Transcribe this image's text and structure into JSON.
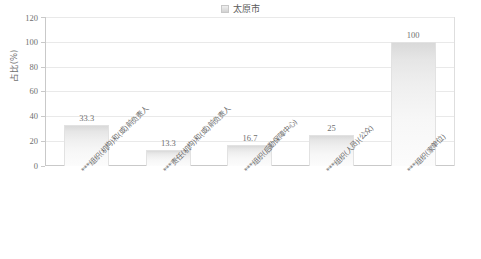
{
  "legend": {
    "items": [
      {
        "label": "太原市",
        "swatch_color": "#e0e0e0"
      }
    ]
  },
  "axes": {
    "ylabel": "占比(%)",
    "yticks": [
      "0",
      "20",
      "40",
      "60",
      "80",
      "100",
      "120"
    ]
  },
  "chart_data": {
    "type": "bar",
    "title": "",
    "subtitle": "",
    "xlabel": "",
    "ylabel": "占比(%)",
    "ylim": [
      0,
      120
    ],
    "ytick_values": [
      0,
      20,
      40,
      60,
      80,
      100,
      120
    ],
    "grid": true,
    "legend_position": "top-center",
    "categories": [
      "***组织(机构)和(或)前负责人",
      "***责任(机构)和(或)前负责人",
      "***组织(后勤保障中心)",
      "***组织(人员)(公众)",
      "***组织(家单位)"
    ],
    "series": [
      {
        "name": "太原市",
        "values": [
          33.3,
          13.3,
          16.7,
          25,
          100
        ],
        "labels": [
          "33.3",
          "13.3",
          "16.7",
          "25",
          "100"
        ],
        "color": "#e6e6e6"
      }
    ]
  }
}
